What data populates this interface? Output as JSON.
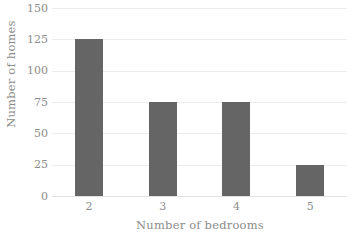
{
  "chart_data": {
    "type": "bar",
    "title": "",
    "categories": [
      "2",
      "3",
      "4",
      "5"
    ],
    "values": [
      125,
      75,
      75,
      25
    ],
    "series": [
      {
        "name": "Number of homes",
        "values": [
          125,
          75,
          75,
          25
        ]
      }
    ],
    "xlabel": "Number of bedrooms",
    "ylabel": "Number of homes",
    "ylim": [
      0,
      150
    ],
    "yticks": [
      0,
      25,
      50,
      75,
      100,
      125,
      150
    ],
    "ytick_labels": [
      "0",
      "25",
      "50",
      "75",
      "100",
      "125",
      "150"
    ],
    "xtick_labels": [
      "2",
      "3",
      "4",
      "5"
    ],
    "grid": "horizontal",
    "legend": "none",
    "bar_color": "#656565",
    "gridline_color": "#ececec",
    "text_color": "#8c8c8c",
    "background_color": "#ffffff"
  }
}
